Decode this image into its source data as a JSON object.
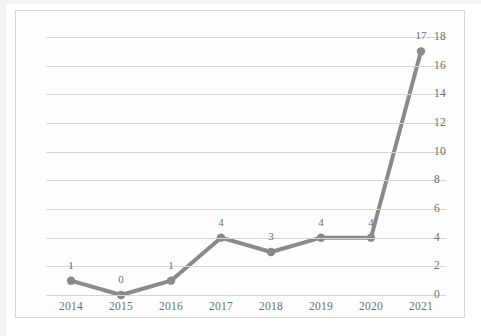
{
  "chart_data": {
    "type": "line",
    "title": "",
    "subtitle": "",
    "xlabel": "",
    "ylabel": "",
    "categories": [
      "2014",
      "2015",
      "2016",
      "2017",
      "2018",
      "2019",
      "2020",
      "2021"
    ],
    "values": [
      1,
      0,
      1,
      4,
      3,
      4,
      4,
      17
    ],
    "point_labels": [
      "1",
      "0",
      "1",
      "4",
      "3",
      "4",
      "4",
      "17"
    ],
    "series": [
      {
        "name": "",
        "values": [
          1,
          0,
          1,
          4,
          3,
          4,
          4,
          17
        ]
      }
    ],
    "ylim": [
      0,
      18
    ],
    "xlim": [
      "2014",
      "2021"
    ],
    "ytick_labels": [
      "18",
      "16",
      "14",
      "12",
      "10",
      "8",
      "6",
      "4",
      "2",
      "0"
    ],
    "ytick_values": [
      18,
      16,
      14,
      12,
      10,
      8,
      6,
      4,
      2,
      0
    ],
    "xtick_labels": [
      "2014",
      "2015",
      "2016",
      "2017",
      "2018",
      "2019",
      "2020",
      "2021"
    ],
    "grid": "horizontal",
    "y_axis_position": "right",
    "legend": "none",
    "legend_position": "none",
    "line_color": "#8a8a8a",
    "marker_color": "#8a8a8a",
    "gridline_color": "#d6d6d6",
    "text_color": "#6d6d6d",
    "background_color": "#fefefe",
    "border_color": "#d8d8d8",
    "marker_style": "circle",
    "data_labels_shown": true
  },
  "caption": {
    "text": ""
  }
}
